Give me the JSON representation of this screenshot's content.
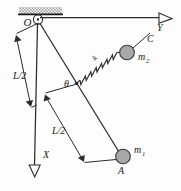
{
  "figure": {
    "width": 181,
    "height": 191,
    "background_color": "#fdfdfd",
    "ink_color": "#2b2b2b",
    "mass_fill_color": "#a8a8a8"
  },
  "labels": {
    "pivot": "O",
    "axis_x": "X",
    "axis_y": "Y",
    "angle": "θ",
    "spring_constant": "k",
    "mass_one_base": "m",
    "mass_one_sub": "1",
    "mass_two_base": "m",
    "mass_two_sub": "2",
    "point_a": "A",
    "point_c": "C",
    "length_upper": "L/2",
    "length_lower": "L/2"
  },
  "elements": {
    "ceiling_support": "hatched-fixed-support",
    "pivot_joint": "hinge-pin",
    "rod": "rigid-rod",
    "spring": "coil-spring",
    "mass_one": "bob-sphere",
    "mass_two": "slider-sphere",
    "dimension_upper": "L/2 along vertical X axis",
    "dimension_lower": "L/2 along rod from theta point to A"
  }
}
